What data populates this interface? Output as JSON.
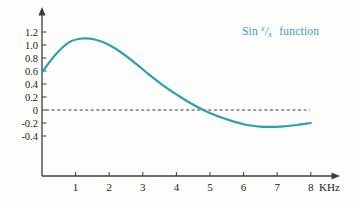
{
  "figure": {
    "background": "#fdfdfc"
  },
  "legend": {
    "prefix": "Sin",
    "numerator": "x",
    "slash": "/",
    "denominator": "x",
    "suffix": "function",
    "color": "#3b9dbc",
    "position": "top-right"
  },
  "chart_data": {
    "type": "line",
    "title": "Sin x/x function",
    "xlabel": "KHz",
    "ylabel": "",
    "x": [
      0,
      0.4,
      0.8,
      1.2,
      1.6,
      2.0,
      2.4,
      2.8,
      3.2,
      3.6,
      4.0,
      4.4,
      4.8,
      5.2,
      5.6,
      6.0,
      6.4,
      6.8,
      7.2,
      7.6,
      8.0
    ],
    "y": [
      0.58,
      0.85,
      1.04,
      1.1,
      1.08,
      1.0,
      0.87,
      0.71,
      0.54,
      0.38,
      0.24,
      0.11,
      0.0,
      -0.09,
      -0.16,
      -0.22,
      -0.25,
      -0.26,
      -0.25,
      -0.23,
      -0.2
    ],
    "x_ticks": [
      1,
      2,
      3,
      4,
      5,
      6,
      7,
      8
    ],
    "x_tick_labels": [
      "1",
      "2",
      "3",
      "4",
      "5",
      "6",
      "7",
      "8"
    ],
    "x_unit_label": "KHz",
    "y_ticks": [
      1.2,
      1.0,
      0.8,
      0.6,
      0.4,
      0.2,
      0,
      -0.2,
      -0.4
    ],
    "y_tick_labels": [
      "1.2",
      "1.0",
      "0.8",
      "0.6",
      "0.4",
      "0.2",
      "0",
      "-0.2",
      "-0.4"
    ],
    "xlim": [
      0,
      8.7
    ],
    "ylim": [
      -1.0,
      1.55
    ],
    "grid": false,
    "zero_line": {
      "y": 0,
      "style": "dashed"
    },
    "line_color": "#2d9fb2",
    "axis_color": "#3d3d3d",
    "tick_label_color": "#222222",
    "legend_position": "top-right"
  }
}
